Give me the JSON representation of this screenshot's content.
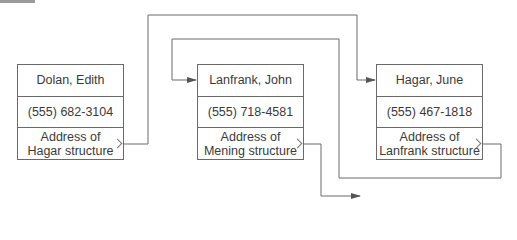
{
  "diagram": {
    "type": "linked-list",
    "colors": {
      "line": "#6a6a6a",
      "text": "#3a3a3a",
      "background": "#ffffff"
    },
    "records": [
      {
        "name": "Dolan, Edith",
        "phone": "(555) 682-3104",
        "pointer_line1": "Address of",
        "pointer_line2": "Hagar structure",
        "points_to": "Hagar, June"
      },
      {
        "name": "Lanfrank, John",
        "phone": "(555) 718-4581",
        "pointer_line1": "Address of",
        "pointer_line2": "Mening structure",
        "points_to": "Mening (off-diagram)"
      },
      {
        "name": "Hagar, June",
        "phone": "(555) 467-1818",
        "pointer_line1": "Address of",
        "pointer_line2": "Lanfrank structure",
        "points_to": "Lanfrank, John"
      }
    ]
  }
}
